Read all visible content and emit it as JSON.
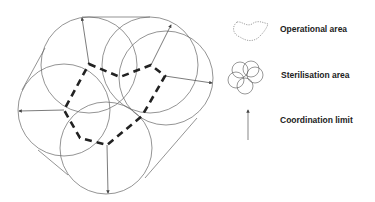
{
  "diagram": {
    "title": "",
    "elements": {
      "sterilisation_circles": 5,
      "operational_area": "dashed polygon connecting circle centres",
      "coordination_limits": 5
    }
  },
  "legend": {
    "items": [
      {
        "icon": "operational-area-icon",
        "label": "Operational area"
      },
      {
        "icon": "sterilisation-area-icon",
        "label": "Sterilisation area"
      },
      {
        "icon": "coordination-limit-icon",
        "label": "Coordination limit"
      }
    ]
  },
  "colors": {
    "line": "#555555",
    "dashed": "#222222",
    "text": "#222222"
  }
}
